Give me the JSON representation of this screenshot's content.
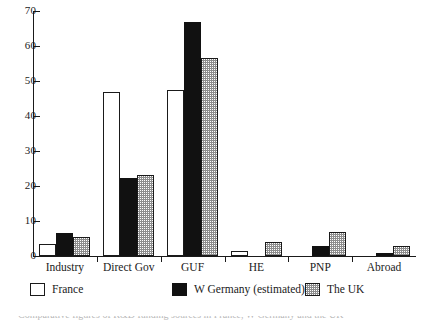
{
  "chart_data": {
    "type": "bar",
    "title": "",
    "subtitle": "",
    "xlabel": "",
    "ylabel": "",
    "ylim": [
      0,
      70
    ],
    "yticks": [
      0,
      10,
      20,
      30,
      40,
      50,
      60,
      70
    ],
    "ytick_labels": [
      "0",
      "10",
      "20",
      "30",
      "40",
      "50",
      "60",
      "70"
    ],
    "grid": false,
    "legend_position": "bottom",
    "categories": [
      "Industry",
      "Direct Gov",
      "GUF",
      "HE",
      "PNP",
      "Abroad"
    ],
    "series": [
      {
        "name": "France",
        "fill": "white",
        "color": "#ffffff",
        "values": [
          3.5,
          47,
          47.5,
          1.3,
          0,
          0
        ]
      },
      {
        "name": "W Germany (estimated)",
        "fill": "solid-black",
        "color": "#111111",
        "values": [
          6.5,
          22.3,
          67,
          0,
          3,
          1
        ]
      },
      {
        "name": "The UK",
        "fill": "stipple",
        "color": "#8d8d8d",
        "values": [
          5.5,
          23.2,
          56.5,
          4,
          7,
          3
        ]
      }
    ]
  },
  "legend": {
    "items": [
      {
        "label": "France",
        "swatch": "france"
      },
      {
        "label": "W Germany (estimated)",
        "swatch": "wgermany"
      },
      {
        "label": "The UK",
        "swatch": "uk"
      }
    ]
  },
  "caption": {
    "cropped_text": "Comparative figures of R&D funding sources in France, W Germany and the UK"
  }
}
